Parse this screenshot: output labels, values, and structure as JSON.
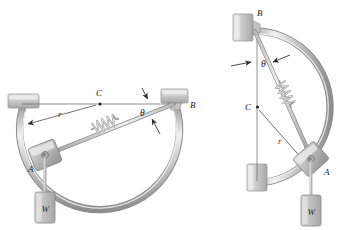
{
  "figure": {
    "background_color": "#ffffff",
    "line_color": "#8d8d8d",
    "rod_color": "#b9b9b9",
    "rod_highlight": "#efefef",
    "block_color": "#cfcfcf",
    "label_color": "#1a1a1a",
    "panels": [
      {
        "id": "left-panel",
        "name": "configuration-horizontal",
        "labels": {
          "center": "C",
          "radius": "r",
          "angle": "θ",
          "collar": "A",
          "pivot": "B",
          "weight": "W"
        }
      },
      {
        "id": "right-panel",
        "name": "configuration-vertical",
        "labels": {
          "center": "C",
          "radius": "r",
          "angle": "θ",
          "collar": "A",
          "pivot": "B",
          "weight": "W"
        }
      }
    ]
  }
}
